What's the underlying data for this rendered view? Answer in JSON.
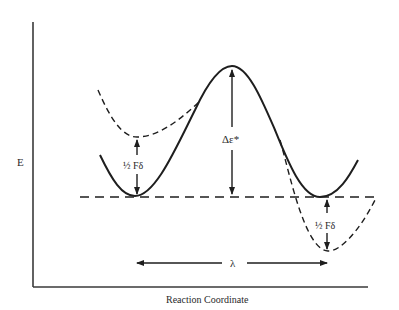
{
  "diagram": {
    "type": "marcus-energy-surface",
    "axes": {
      "y_label": "E",
      "x_label": "Reaction Coordinate"
    },
    "annotations": {
      "barrier": "Δε*",
      "left_shift": "½ Fδ",
      "right_shift": "½ Fδ",
      "reorganization": "λ"
    },
    "curves": [
      {
        "name": "adiabatic-surface",
        "style": "solid"
      },
      {
        "name": "left-diabatic-shifted",
        "style": "dashed"
      },
      {
        "name": "right-diabatic-shifted",
        "style": "dashed"
      },
      {
        "name": "baseline",
        "style": "dashed"
      }
    ],
    "colors": {
      "line": "#1e1e1e",
      "background": "#ffffff"
    }
  }
}
